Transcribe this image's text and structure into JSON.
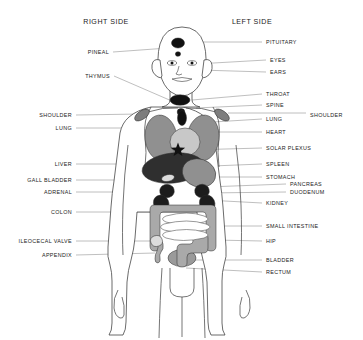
{
  "figure": {
    "background": "#ffffff",
    "headers": {
      "right": "RIGHT SIDE",
      "left": "LEFT SIDE"
    }
  },
  "palette": {
    "outline": "#3a3a3a",
    "leader": "#8a8a8a",
    "text": "#1a1a1a",
    "organ_black": "#111111",
    "organ_dark": "#2f2f2f",
    "organ_mid": "#909090",
    "organ_light": "#c8c8c8",
    "organ_pale": "#dcdcdc",
    "skin": "#ffffff"
  },
  "labels_left_column": [
    {
      "id": "pineal",
      "text": "PINEAL",
      "x": 109,
      "y": 52,
      "line_to_x": 168,
      "line_to_y": 48
    },
    {
      "id": "thymus",
      "text": "THYMUS",
      "x": 110,
      "y": 76,
      "line_to_x": 181,
      "line_to_y": 105
    },
    {
      "id": "shoulder-right",
      "text": "SHOULDER",
      "x": 72,
      "y": 115,
      "line_to_x": 140,
      "line_to_y": 114
    },
    {
      "id": "lung-right",
      "text": "LUNG",
      "x": 72,
      "y": 128,
      "line_to_x": 152,
      "line_to_y": 128
    },
    {
      "id": "liver",
      "text": "LIVER",
      "x": 72,
      "y": 164,
      "line_to_x": 150,
      "line_to_y": 164
    },
    {
      "id": "gall-bladder",
      "text": "GALL BLADDER",
      "x": 72,
      "y": 180,
      "line_to_x": 162,
      "line_to_y": 180
    },
    {
      "id": "adrenal",
      "text": "ADRENAL",
      "x": 72,
      "y": 192,
      "line_to_x": 163,
      "line_to_y": 192
    },
    {
      "id": "colon",
      "text": "COLON",
      "x": 72,
      "y": 212,
      "line_to_x": 155,
      "line_to_y": 212
    },
    {
      "id": "ileocecal-valve",
      "text": "ILEOCECAL VALVE",
      "x": 72,
      "y": 241,
      "line_to_x": 156,
      "line_to_y": 241
    },
    {
      "id": "appendix",
      "text": "APPENDIX",
      "x": 72,
      "y": 255,
      "line_to_x": 155,
      "line_to_y": 253
    }
  ],
  "labels_right_column": [
    {
      "id": "pituitary",
      "text": "PITUITARY",
      "x": 266,
      "y": 42,
      "line_to_x": 190,
      "line_to_y": 42
    },
    {
      "id": "eyes",
      "text": "EYES",
      "x": 270,
      "y": 60,
      "line_to_x": 196,
      "line_to_y": 64
    },
    {
      "id": "ears",
      "text": "EARS",
      "x": 270,
      "y": 72,
      "line_to_x": 199,
      "line_to_y": 70
    },
    {
      "id": "throat",
      "text": "THROAT",
      "x": 266,
      "y": 94,
      "line_to_x": 192,
      "line_to_y": 100
    },
    {
      "id": "spine",
      "text": "SPINE",
      "x": 266,
      "y": 105,
      "line_to_x": 196,
      "line_to_y": 108
    },
    {
      "id": "lung-left",
      "text": "LUNG",
      "x": 266,
      "y": 119,
      "line_to_x": 213,
      "line_to_y": 122
    },
    {
      "id": "heart",
      "text": "HEART",
      "x": 266,
      "y": 132,
      "line_to_x": 196,
      "line_to_y": 132
    },
    {
      "id": "solar-plexus",
      "text": "SOLAR PLEXUS",
      "x": 266,
      "y": 148,
      "line_to_x": 189,
      "line_to_y": 150
    },
    {
      "id": "spleen",
      "text": "SPLEEN",
      "x": 266,
      "y": 164,
      "line_to_x": 212,
      "line_to_y": 166
    },
    {
      "id": "stomach",
      "text": "STOMACH",
      "x": 266,
      "y": 177,
      "line_to_x": 205,
      "line_to_y": 177
    },
    {
      "id": "pancreas",
      "text": "PANCREAS",
      "x": 290,
      "y": 184,
      "line_to_x": 207,
      "line_to_y": 187
    },
    {
      "id": "duodenum",
      "text": "DUODENUM",
      "x": 290,
      "y": 192,
      "line_to_x": 207,
      "line_to_y": 193
    },
    {
      "id": "kidney",
      "text": "KIDNEY",
      "x": 266,
      "y": 203,
      "line_to_x": 206,
      "line_to_y": 200
    },
    {
      "id": "small-intestine",
      "text": "SMALL INTESTINE",
      "x": 266,
      "y": 226,
      "line_to_x": 200,
      "line_to_y": 226
    },
    {
      "id": "hip",
      "text": "HIP",
      "x": 266,
      "y": 241,
      "line_to_x": 214,
      "line_to_y": 240
    },
    {
      "id": "bladder",
      "text": "BLADDER",
      "x": 266,
      "y": 260,
      "line_to_x": 192,
      "line_to_y": 260
    },
    {
      "id": "rectum",
      "text": "RECTUM",
      "x": 266,
      "y": 272,
      "line_to_x": 186,
      "line_to_y": 268
    }
  ],
  "labels_outer": [
    {
      "id": "shoulder-left",
      "text": "SHOULDER",
      "x": 310,
      "y": 115,
      "line_from_x": 306,
      "line_from_y": 113,
      "line_to_x": 228,
      "line_to_y": 113
    }
  ],
  "organs": [
    {
      "id": "pituitary-mark",
      "name": "pituitary",
      "shape": "ellipse",
      "cx": 178,
      "cy": 43,
      "rx": 6.5,
      "ry": 5.0,
      "fill": "#111111",
      "rotate": 0
    },
    {
      "id": "pineal-mark",
      "name": "pineal",
      "shape": "ellipse",
      "cx": 178,
      "cy": 54,
      "rx": 2.6,
      "ry": 2.3,
      "fill": "#111111",
      "rotate": 0
    },
    {
      "id": "throat-mark",
      "name": "throat",
      "shape": "ellipse",
      "cx": 180,
      "cy": 100,
      "rx": 10,
      "ry": 5.2,
      "fill": "#111111",
      "rotate": 0
    },
    {
      "id": "thymus-mark",
      "name": "thymus",
      "shape": "ellipse",
      "cx": 181,
      "cy": 112,
      "rx": 3.8,
      "ry": 3.4,
      "fill": "#111111",
      "rotate": 0
    },
    {
      "id": "shoulder-r-mark",
      "name": "shoulder-right",
      "shape": "ellipse",
      "cx": 142,
      "cy": 115,
      "rx": 8.5,
      "ry": 4.2,
      "fill": "#7d7d7d",
      "rotate": -35
    },
    {
      "id": "shoulder-l-mark",
      "name": "shoulder-left",
      "shape": "ellipse",
      "cx": 222,
      "cy": 115,
      "rx": 8.5,
      "ry": 4.2,
      "fill": "#7d7d7d",
      "rotate": 35
    },
    {
      "id": "lung-right-mark",
      "name": "lung-right",
      "shape": "ellipse",
      "cx": 161,
      "cy": 138,
      "rx": 16,
      "ry": 23,
      "fill": "#909090",
      "rotate": -6
    },
    {
      "id": "lung-left-mark",
      "name": "lung-left",
      "shape": "ellipse",
      "cx": 203,
      "cy": 138,
      "rx": 16,
      "ry": 23,
      "fill": "#909090",
      "rotate": 6
    },
    {
      "id": "spine-mark",
      "name": "spine",
      "shape": "ellipse",
      "cx": 182,
      "cy": 118,
      "rx": 4.5,
      "ry": 7.5,
      "fill": "#111111",
      "rotate": 0
    },
    {
      "id": "heart-mark",
      "name": "heart",
      "shape": "ellipse",
      "cx": 185,
      "cy": 142,
      "rx": 15,
      "ry": 14,
      "fill": "#c8c8c8",
      "rotate": 0
    },
    {
      "id": "liver-mark",
      "name": "liver",
      "shape": "ellipse",
      "cx": 173,
      "cy": 168,
      "rx": 31,
      "ry": 15,
      "fill": "#2f2f2f",
      "rotate": -6
    },
    {
      "id": "stomach-mark",
      "name": "stomach",
      "shape": "ellipse",
      "cx": 199,
      "cy": 173,
      "rx": 17,
      "ry": 14,
      "fill": "#909090",
      "rotate": 18
    },
    {
      "id": "gallbladder-mark",
      "name": "gall-bladder",
      "shape": "ellipse",
      "cx": 168,
      "cy": 178,
      "rx": 6.5,
      "ry": 3.4,
      "fill": "#dcdcdc",
      "rotate": -12
    },
    {
      "id": "bladder-mark",
      "name": "bladder",
      "shape": "ellipse",
      "cx": 182,
      "cy": 258,
      "rx": 14,
      "ry": 8.5,
      "fill": "#9a9a9a",
      "rotate": 0
    },
    {
      "id": "solar-plexus-star",
      "name": "solar-plexus",
      "shape": "star",
      "cx": 178,
      "cy": 150,
      "r": 7.5,
      "fill": "#111111",
      "rotate": 0
    }
  ],
  "organ_paths": [
    {
      "id": "adrenal-right",
      "name": "adrenal-right",
      "fill": "#1c1c1c",
      "d": "M162 186 q6 -4 11 1 q3 5 -1 9 q-6 4 -11 -1 q-3 -5 1 -9 Z"
    },
    {
      "id": "adrenal-left",
      "name": "adrenal-left",
      "fill": "#1c1c1c",
      "d": "M197 186 q6 -4 11 1 q3 5 -1 9 q-6 4 -11 -1 q-3 -5 1 -9 Z"
    },
    {
      "id": "kidney-right",
      "name": "kidney-right",
      "fill": "#1c1c1c",
      "d": "M157 196 q7 -3 11 4 q3 7 -3 10 q-8 3 -11 -4 q-2 -7 3 -10 Z"
    },
    {
      "id": "kidney-left",
      "name": "kidney-left",
      "fill": "#1c1c1c",
      "d": "M203 196 q7 -3 11 4 q3 7 -3 10 q-8 3 -11 -4 q-2 -7 3 -10 Z"
    },
    {
      "id": "colon-frame",
      "name": "colon",
      "fill": "#a9a9a9",
      "d": "M154 205 q-4 0 -4 5 l0 36 q0 5 5 5 q5 0 5 -5 l0 -31 q0 -3 3 -3 l40 0 q3 0 3 3 l0 31 q0 5 5 5 q5 0 5 -5 l0 -36 q0 -5 -5 -5 Z"
    },
    {
      "id": "rectum-shape",
      "name": "rectum",
      "fill": "#a9a9a9",
      "d": "M174 238 q0 -5 5 -5 l24 0 q5 0 5 5 l0 10 q0 5 -5 5 l-12 0 q-4 0 -4 4 l0 6 q0 4 -5 4 q-5 0 -5 -4 l0 -14 q0 -5 5 -5 l8 0 q3 0 3 -3 q0 -3 -3 -3 l-11 0 q-5 0 -5 -5 Z"
    },
    {
      "id": "appendix-shape",
      "name": "appendix",
      "fill": "#a9a9a9",
      "d": "M157 240 q5 -1 6 4 q1 5 -2 8 q-2 3 -1 6 q1 4 -2 5 q-3 0 -3 -4 q0 -5 2 -8 q2 -4 0 -7 q-2 -3 0 -4 Z"
    },
    {
      "id": "ileocecal-dot",
      "name": "ileocecal-valve",
      "fill": "#dcdcdc",
      "d": "M154 236 q6 -2 8 3 q2 5 -3 7 q-6 2 -8 -3 q-2 -5 3 -7 Z"
    }
  ],
  "small_intestine": {
    "name": "small-intestine",
    "fill": "#ffffff",
    "stroke": "#555555",
    "loops": [
      "M166 216 q22 -6 38 0 q8 3 0 6 q-22 5 -38 0 q-7 -3 0 -6 Z",
      "M164 224 q24 -6 42 0 q8 3 0 6 q-24 5 -42 0 q-7 -3 0 -6 Z",
      "M166 232 q22 -5 38 0 q8 3 0 6 q-22 5 -38 0 q-7 -3 0 -6 Z"
    ]
  }
}
